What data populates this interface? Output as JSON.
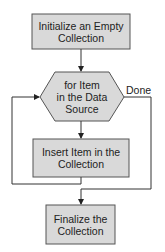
{
  "diagram": {
    "type": "flowchart",
    "colors": {
      "fill": "#d9d9d9",
      "stroke": "#555555",
      "line": "#333333",
      "text": "#222222"
    },
    "nodes": [
      {
        "id": "init",
        "shape": "rectangle",
        "line1": "Initialize an Empty",
        "line2": "Collection"
      },
      {
        "id": "loop",
        "shape": "hexagon",
        "line1": "for Item",
        "line2": "in the Data",
        "line3": "Source"
      },
      {
        "id": "insert",
        "shape": "rectangle",
        "line1": "Insert Item in the",
        "line2": "Collection"
      },
      {
        "id": "finalize",
        "shape": "rectangle",
        "line1": "Finalize the",
        "line2": "Collection"
      }
    ],
    "edges": [
      {
        "from": "init",
        "to": "loop",
        "label": ""
      },
      {
        "from": "loop",
        "to": "insert",
        "label": ""
      },
      {
        "from": "insert",
        "to": "loop",
        "label": ""
      },
      {
        "from": "loop",
        "to": "finalize",
        "label": "Done"
      }
    ],
    "done_label": "Done"
  }
}
